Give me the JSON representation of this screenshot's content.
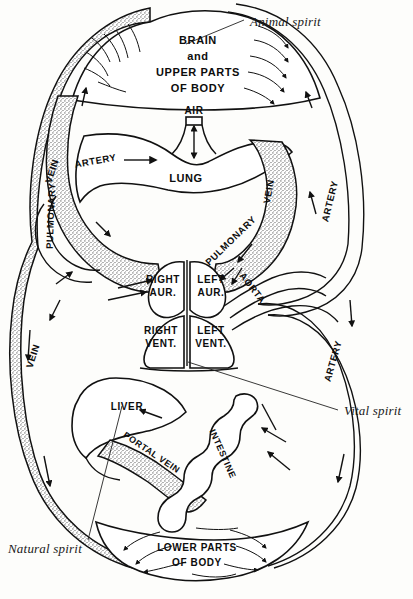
{
  "figure": {
    "background_color": "#fdfdfb",
    "ink_color": "#111111"
  },
  "annotations": [
    {
      "id": "animal-spirit",
      "text": "Animal spirit",
      "style": "italic-serif",
      "x": 250,
      "y": 24
    },
    {
      "id": "vital-spirit",
      "text": "Vital spirit",
      "style": "italic-serif",
      "x": 344,
      "y": 413
    },
    {
      "id": "natural-spirit",
      "text": "Natural spirit",
      "style": "italic-serif",
      "x": 8,
      "y": 551
    }
  ],
  "organs": [
    {
      "id": "brain",
      "lines": [
        "BRAIN",
        "and",
        "UPPER PARTS",
        "OF BODY"
      ],
      "x": 198,
      "y": 48
    },
    {
      "id": "air",
      "lines": [
        "AIR"
      ],
      "x": 194,
      "y": 114
    },
    {
      "id": "lung",
      "lines": [
        "LUNG"
      ],
      "x": 186,
      "y": 178
    },
    {
      "id": "right-aur",
      "lines": [
        "RIGHT",
        "AUR."
      ],
      "x": 161,
      "y": 281
    },
    {
      "id": "left-aur",
      "lines": [
        "LEFT",
        "AUR."
      ],
      "x": 211,
      "y": 281
    },
    {
      "id": "right-vent",
      "lines": [
        "RIGHT",
        "VENT."
      ],
      "x": 159,
      "y": 330
    },
    {
      "id": "left-vent",
      "lines": [
        "LEFT",
        "VENT."
      ],
      "x": 210,
      "y": 330
    },
    {
      "id": "liver",
      "lines": [
        "LIVER"
      ],
      "x": 125,
      "y": 406
    },
    {
      "id": "lower-body",
      "lines": [
        "LOWER PARTS",
        "OF BODY"
      ],
      "x": 197,
      "y": 547
    }
  ],
  "vessels": [
    {
      "id": "vein-upper-left",
      "text": "VEIN",
      "x": 55,
      "y": 170,
      "rotate": -72
    },
    {
      "id": "artery-lung-left",
      "text": "ARTERY",
      "x": 94,
      "y": 163,
      "rotate": -10
    },
    {
      "id": "pulmonary-left",
      "text": "PULMONARY",
      "x": 54,
      "y": 215,
      "rotate": -88
    },
    {
      "id": "pulmonary-vein-right",
      "text": "PULMONARY",
      "x": 231,
      "y": 240,
      "rotate": -44
    },
    {
      "id": "vein-right",
      "text": "VEIN",
      "x": 272,
      "y": 190,
      "rotate": -80
    },
    {
      "id": "artery-right-upper",
      "text": "ARTERY",
      "x": 331,
      "y": 200,
      "rotate": -76
    },
    {
      "id": "artery-right-lower",
      "text": "ARTERY",
      "x": 334,
      "y": 360,
      "rotate": -74
    },
    {
      "id": "aorta",
      "text": "AORTA",
      "x": 248,
      "y": 288,
      "rotate": 52
    },
    {
      "id": "vein-lower-left",
      "text": "VEIN",
      "x": 36,
      "y": 355,
      "rotate": -72
    },
    {
      "id": "portal-vein",
      "text": "PORTAL VEIN",
      "x": 148,
      "y": 452,
      "rotate": 34
    },
    {
      "id": "intestine",
      "text": "INTESTINE",
      "x": 218,
      "y": 452,
      "rotate": 66
    }
  ]
}
